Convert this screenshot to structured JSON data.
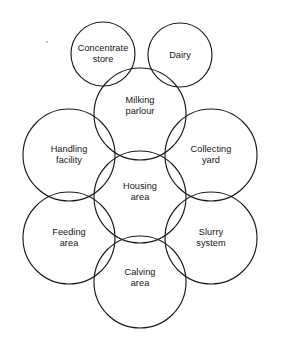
{
  "diagram": {
    "type": "overlapping-circles",
    "background_color": "#ffffff",
    "stroke_color": "#1a1a1a",
    "nodes": [
      {
        "id": "concentrate-store",
        "label_lines": [
          "Concentrate",
          "store"
        ],
        "cx": 103,
        "cy": 54,
        "r": 32
      },
      {
        "id": "dairy",
        "label_lines": [
          "Dairy"
        ],
        "cx": 180,
        "cy": 55,
        "r": 32
      },
      {
        "id": "milking-parlour",
        "label_lines": [
          "Milking",
          "parlour"
        ],
        "cx": 140,
        "cy": 114,
        "r": 46
      },
      {
        "id": "handling-facility",
        "label_lines": [
          "Handling",
          "facility"
        ],
        "cx": 69,
        "cy": 155,
        "r": 46
      },
      {
        "id": "collecting-yard",
        "label_lines": [
          "Collecting",
          "yard"
        ],
        "cx": 211,
        "cy": 155,
        "r": 46
      },
      {
        "id": "housing-area",
        "label_lines": [
          "Housing",
          "area"
        ],
        "cx": 140,
        "cy": 197,
        "r": 46
      },
      {
        "id": "feeding-area",
        "label_lines": [
          "Feeding",
          "area"
        ],
        "cx": 69,
        "cy": 238,
        "r": 46
      },
      {
        "id": "slurry-system",
        "label_lines": [
          "Slurry",
          "system"
        ],
        "cx": 211,
        "cy": 238,
        "r": 46
      },
      {
        "id": "calving-area",
        "label_lines": [
          "Calving",
          "area"
        ],
        "cx": 140,
        "cy": 282,
        "r": 46
      }
    ],
    "labels": {
      "concentrate_store_line1": "Concentrate",
      "concentrate_store_line2": "store",
      "dairy_line1": "Dairy",
      "milking_parlour_line1": "Milking",
      "milking_parlour_line2": "parlour",
      "handling_facility_line1": "Handling",
      "handling_facility_line2": "facility",
      "collecting_yard_line1": "Collecting",
      "collecting_yard_line2": "yard",
      "housing_area_line1": "Housing",
      "housing_area_line2": "area",
      "feeding_area_line1": "Feeding",
      "feeding_area_line2": "area",
      "slurry_system_line1": "Slurry",
      "slurry_system_line2": "system",
      "calving_area_line1": "Calving",
      "calving_area_line2": "area"
    },
    "label_offsets": {
      "concentrate_store_y": 54,
      "dairy_y": 55,
      "milking_parlour_y": 106,
      "handling_facility_y": 155,
      "collecting_yard_y": 155,
      "housing_area_y": 192,
      "feeding_area_y": 238,
      "slurry_system_y": 238,
      "calving_area_y": 278
    }
  }
}
